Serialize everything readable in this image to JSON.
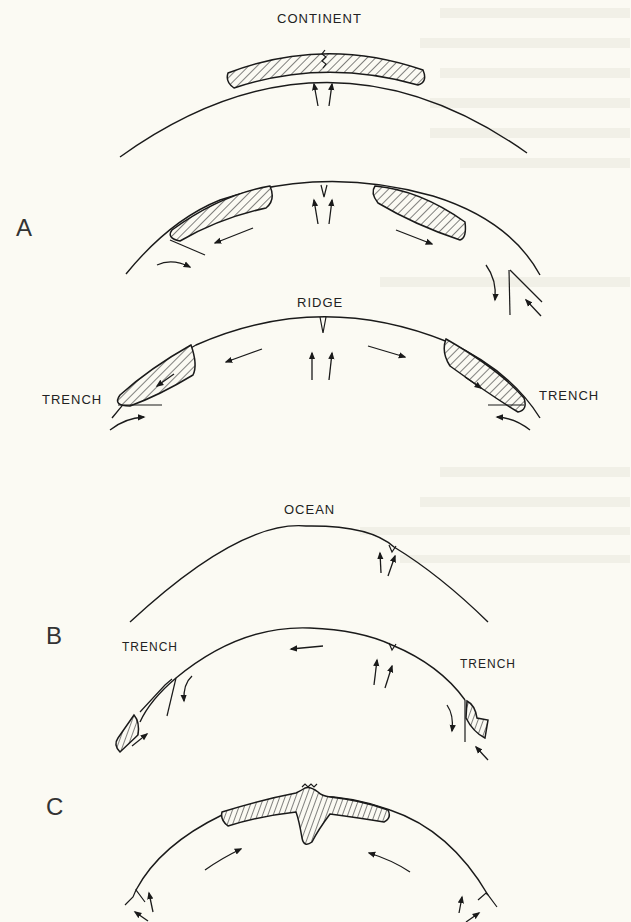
{
  "figure": {
    "background_color": "#fbfaf3",
    "ink_color": "#1a1a1a"
  },
  "panels": {
    "A": {
      "label": "A",
      "stages": [
        {
          "id": "A1",
          "top_label": "CONTINENT",
          "features": [
            "hatched continent",
            "rift crack at center",
            "two upward arrows"
          ]
        },
        {
          "id": "A2",
          "top_label": "",
          "features": [
            "split continent halves",
            "central rift",
            "upwelling arrows",
            "divergent arrows",
            "subduction at edges"
          ]
        },
        {
          "id": "A3",
          "top_label": "RIDGE",
          "left_label": "TRENCH",
          "right_label": "TRENCH",
          "features": [
            "mid-ocean ridge",
            "continents at trenches",
            "subduction arrows"
          ]
        }
      ]
    },
    "B": {
      "label": "B",
      "stages": [
        {
          "id": "B1",
          "top_label": "OCEAN",
          "features": [
            "oceanic arc",
            "off-center ridge with upwelling arrows"
          ]
        },
        {
          "id": "B2",
          "top_label": "",
          "left_label": "TRENCH",
          "right_label": "TRENCH",
          "features": [
            "off-center ridge",
            "leftward plate arrow",
            "trenches at both ends",
            "small hatched continents at edges"
          ]
        }
      ]
    },
    "C": {
      "label": "C",
      "stages": [
        {
          "id": "C1",
          "top_label": "",
          "features": [
            "collided continent with mountain root",
            "convergent arrows",
            "ridges at edges"
          ]
        }
      ]
    }
  }
}
